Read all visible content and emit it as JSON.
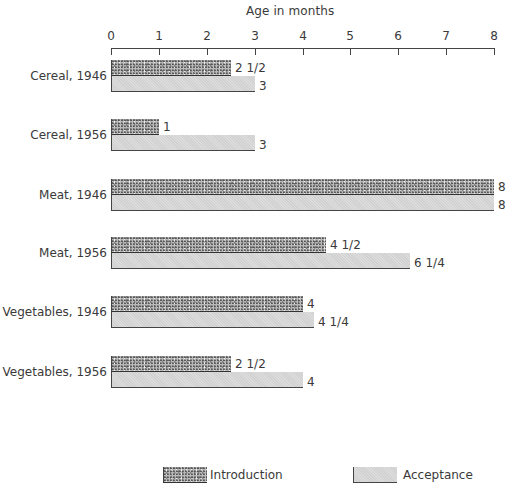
{
  "chart_data": {
    "type": "bar",
    "orientation": "horizontal",
    "title": "",
    "xlabel": "Age in months",
    "ylabel": "",
    "xlim": [
      0,
      8
    ],
    "x_ticks": [
      "0",
      "1",
      "2",
      "3",
      "4",
      "5",
      "6",
      "7",
      "8"
    ],
    "grid": false,
    "legend_position": "bottom",
    "categories": [
      "Cereal, 1946",
      "Cereal, 1956",
      "Meat, 1946",
      "Meat, 1956",
      "Vegetables, 1946",
      "Vegetables, 1956"
    ],
    "series": [
      {
        "name": "Introduction",
        "values": [
          2.5,
          1,
          8,
          4.5,
          4,
          2.5
        ],
        "labels": [
          "2 1/2",
          "1",
          "8",
          "4 1/2",
          "4",
          "2 1/2"
        ]
      },
      {
        "name": "Acceptance",
        "values": [
          3,
          3,
          8,
          6.25,
          4.25,
          4
        ],
        "labels": [
          "3",
          "3",
          "8",
          "6 1/4",
          "4 1/4",
          "4"
        ]
      }
    ]
  },
  "axis": {
    "title": "Age in months",
    "ticks": [
      "0",
      "1",
      "2",
      "3",
      "4",
      "5",
      "6",
      "7",
      "8"
    ]
  },
  "groups": [
    {
      "label": "Cereal, 1946",
      "intro_label": "2 1/2",
      "accept_label": "3"
    },
    {
      "label": "Cereal, 1956",
      "intro_label": "1",
      "accept_label": "3"
    },
    {
      "label": "Meat, 1946",
      "intro_label": "8",
      "accept_label": "8"
    },
    {
      "label": "Meat, 1956",
      "intro_label": "4 1/2",
      "accept_label": "6 1/4"
    },
    {
      "label": "Vegetables, 1946",
      "intro_label": "4",
      "accept_label": "4 1/4"
    },
    {
      "label": "Vegetables, 1956",
      "intro_label": "2 1/2",
      "accept_label": "4"
    }
  ],
  "legend": {
    "introduction": "Introduction",
    "acceptance": "Acceptance"
  }
}
